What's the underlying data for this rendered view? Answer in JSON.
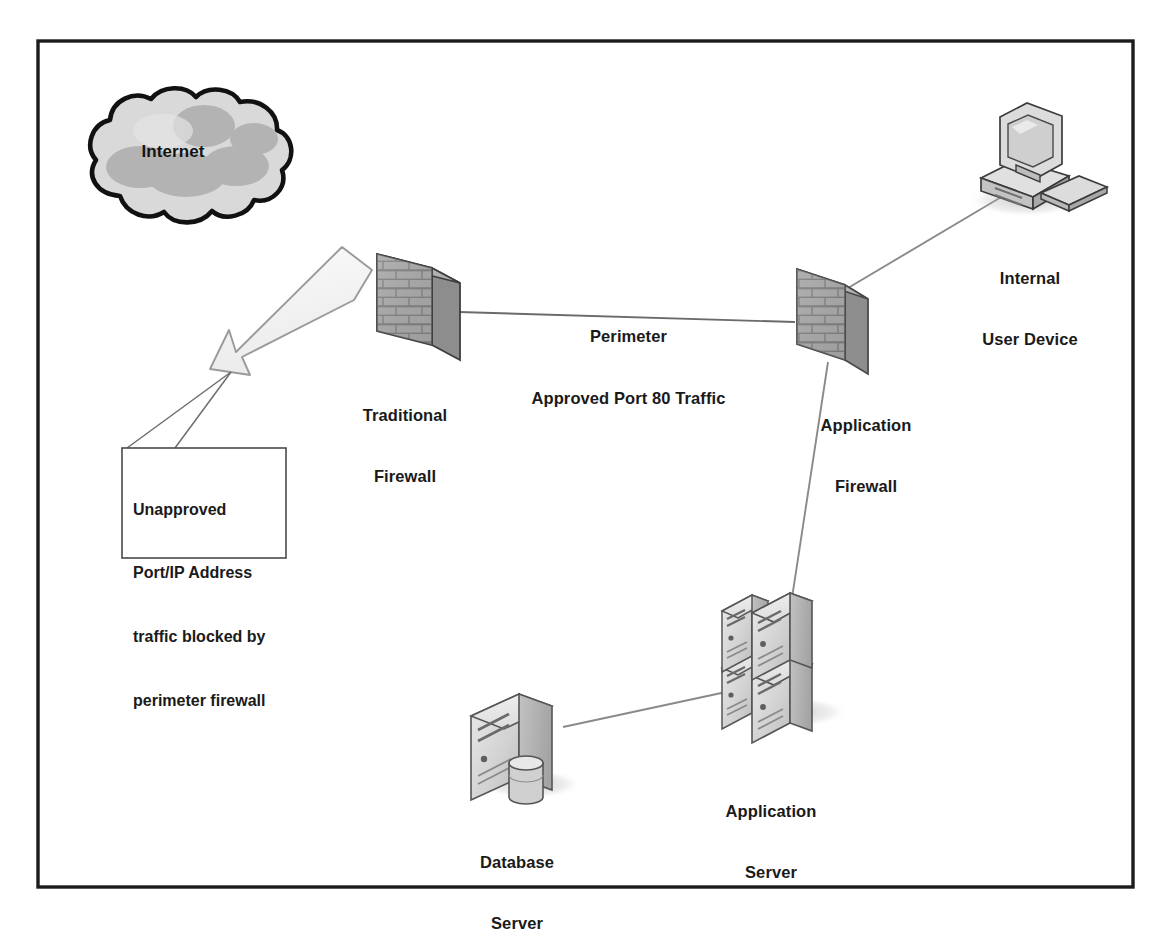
{
  "diagram": {
    "frame": {
      "border_color": "#1c1c1c",
      "background": "#ffffff"
    },
    "nodes": [
      {
        "id": "internet",
        "icon": "cloud-icon",
        "label": "Internet",
        "label_lines": [
          "Internet"
        ],
        "label_position": "inside",
        "fill": "#d9d9d9",
        "accent": "#b3b3b3",
        "stroke": "#111111"
      },
      {
        "id": "traditional-firewall",
        "icon": "brick-wall-icon",
        "label": "Traditional Firewall",
        "label_lines": [
          "Traditional",
          "Firewall"
        ],
        "fill": "#9b9b9b",
        "stroke": "#3a3a3a"
      },
      {
        "id": "application-firewall",
        "icon": "brick-wall-icon",
        "label": "Application Firewall",
        "label_lines": [
          "Application",
          "Firewall"
        ],
        "fill": "#a8a8a8",
        "stroke": "#4a4a4a"
      },
      {
        "id": "internal-user-device",
        "icon": "desktop-computer-icon",
        "label": "Internal User Device",
        "label_lines": [
          "Internal",
          "User Device"
        ],
        "fill": "#d5d5d5",
        "stroke": "#3a3a3a"
      },
      {
        "id": "application-server",
        "icon": "server-stack-icon",
        "label": "Application Server",
        "label_lines": [
          "Application",
          "Server"
        ],
        "fill": "#d9d9d9",
        "stroke": "#555555"
      },
      {
        "id": "database-server",
        "icon": "database-server-icon",
        "label": "Database Server",
        "label_lines": [
          "Database",
          "Server"
        ],
        "fill": "#d9d9d9",
        "stroke": "#555555"
      }
    ],
    "connections": [
      {
        "id": "fw-to-appfw",
        "from": "traditional-firewall",
        "to": "application-firewall",
        "label_lines": [
          "Perimeter",
          "Approved Port 80 Traffic"
        ],
        "label": "Perimeter Approved Port 80 Traffic",
        "style": "solid-line"
      },
      {
        "id": "appfw-to-user",
        "from": "application-firewall",
        "to": "internal-user-device",
        "label": "",
        "style": "solid-line"
      },
      {
        "id": "appfw-to-appserver",
        "from": "application-firewall",
        "to": "application-server",
        "label": "",
        "style": "solid-line"
      },
      {
        "id": "appserver-to-db",
        "from": "application-server",
        "to": "database-server",
        "label": "",
        "style": "solid-line"
      }
    ],
    "blocked_flow": {
      "id": "blocked-traffic-arrow",
      "icon": "bent-block-arrow-icon",
      "from": "traditional-firewall",
      "direction": "rejected back toward Internet",
      "fill": "#f2f2f2",
      "stroke": "#8a8a8a"
    },
    "callout": {
      "id": "blocked-traffic-callout",
      "lines": [
        "Unapproved",
        "Port/IP Address",
        "traffic blocked by",
        "perimeter firewall"
      ],
      "text": "Unapproved Port/IP Address traffic blocked by perimeter firewall",
      "border_color": "#4a4a4a",
      "background": "#ffffff"
    }
  }
}
